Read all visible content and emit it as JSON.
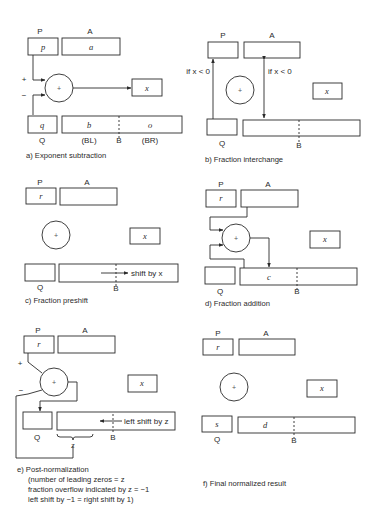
{
  "labels": {
    "P": "P",
    "A": "A",
    "Q": "Q",
    "B": "B",
    "x": "x",
    "plus": "+",
    "minus": "−",
    "adder": "+"
  },
  "panel_a": {
    "caption": "a)  Exponent subtraction",
    "p_value": "p",
    "a_value": "a",
    "q_value": "q",
    "bl_value": "b",
    "br_value": "o",
    "bl_label": "(BL)",
    "br_label": "(BR)"
  },
  "panel_b": {
    "caption": "b)  Fraction interchange",
    "left_condition": "if x < 0",
    "right_condition": "if x < 0"
  },
  "panel_c": {
    "caption": "c)  Fraction preshift",
    "p_value": "r",
    "shift_label": "shift by x"
  },
  "panel_d": {
    "caption": "d)  Fraction addition",
    "p_value": "r",
    "b_value": "c"
  },
  "panel_e": {
    "caption": "e)  Post-normalization",
    "note_line1": "(number of leading zeros = z",
    "note_line2": "fraction overflow indicated by z = −1",
    "note_line3": "left shift by −1 = right shift by 1)",
    "p_value": "r",
    "shift_label": "left shift by z",
    "brace_label": "z"
  },
  "panel_f": {
    "caption": "f)  Final normalized result",
    "p_value": "r",
    "q_value": "s",
    "b_value": "d"
  }
}
